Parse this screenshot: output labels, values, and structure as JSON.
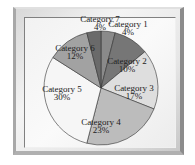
{
  "chart_data": {
    "type": "pie",
    "title": "",
    "categories": [
      "Category 1",
      "Category 2",
      "Category 3",
      "Category 4",
      "Category 5",
      "Category 6",
      "Category 7"
    ],
    "values": [
      4,
      10,
      17,
      23,
      30,
      12,
      4
    ],
    "labels": [
      "4%",
      "10%",
      "17%",
      "23%",
      "30%",
      "12%",
      "4%"
    ],
    "colors": [
      "#8a8a8a",
      "#767676",
      "#dedede",
      "#bcbcbc",
      "#f6f6f6",
      "#a2a2a2",
      "#6a6a6a"
    ],
    "start_angle_deg": 0,
    "direction": "clockwise",
    "legend": "none",
    "data_labels": "category name and percent"
  },
  "slices": [
    {
      "name": "Category 1",
      "pct": "4%"
    },
    {
      "name": "Category 2",
      "pct": "10%"
    },
    {
      "name": "Category 3",
      "pct": "17%"
    },
    {
      "name": "Category 4",
      "pct": "23%"
    },
    {
      "name": "Category 5",
      "pct": "30%"
    },
    {
      "name": "Category 6",
      "pct": "12%"
    },
    {
      "name": "Category 7",
      "pct": "4%"
    }
  ]
}
